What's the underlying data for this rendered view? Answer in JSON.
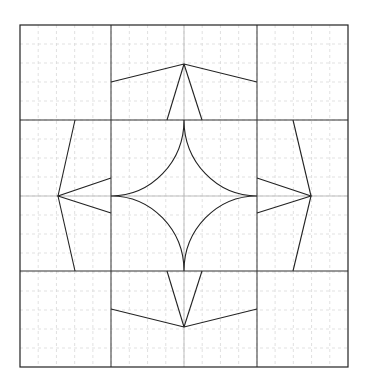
{
  "diagram": {
    "type": "quilt-block-pattern",
    "canvas": {
      "width": 369,
      "height": 390,
      "background": "#ffffff"
    },
    "frame": {
      "x0": 20,
      "y0": 25,
      "x1": 348,
      "y1": 367,
      "stroke": "#222222"
    },
    "grid_divisions": 18,
    "grid_color": "#d9d9d9",
    "center_guide_color": "#bdbdbd",
    "block_lines": {
      "x": [
        111,
        257
      ],
      "y": [
        120,
        271
      ]
    },
    "kites": [
      {
        "name": "top-kite",
        "points": [
          [
            111,
            82
          ],
          [
            184,
            64
          ],
          [
            257,
            82
          ]
        ],
        "legs": [
          [
            [
              167,
              120
            ],
            [
              184,
              64
            ]
          ],
          [
            [
              202,
              120
            ],
            [
              184,
              64
            ]
          ]
        ]
      },
      {
        "name": "bottom-kite",
        "points": [
          [
            111,
            309
          ],
          [
            184,
            327
          ],
          [
            257,
            309
          ]
        ],
        "legs": [
          [
            [
              167,
              271
            ],
            [
              184,
              327
            ]
          ],
          [
            [
              202,
              271
            ],
            [
              184,
              327
            ]
          ]
        ]
      },
      {
        "name": "left-kite",
        "points": [
          [
            111,
            178
          ],
          [
            58,
            196
          ],
          [
            111,
            213
          ]
        ],
        "legs": [
          [
            [
              75,
              120
            ],
            [
              58,
              196
            ]
          ],
          [
            [
              75,
              271
            ],
            [
              58,
              196
            ]
          ]
        ]
      },
      {
        "name": "right-kite",
        "points": [
          [
            257,
            178
          ],
          [
            311,
            196
          ],
          [
            257,
            213
          ]
        ],
        "legs": [
          [
            [
              293,
              120
            ],
            [
              311,
              196
            ]
          ],
          [
            [
              293,
              271
            ],
            [
              311,
              196
            ]
          ]
        ]
      }
    ],
    "center_star": {
      "name": "curved-four-point-star",
      "top": [
        184,
        120
      ],
      "right": [
        257,
        196
      ],
      "bottom": [
        184,
        271
      ],
      "left": [
        111,
        196
      ]
    }
  }
}
